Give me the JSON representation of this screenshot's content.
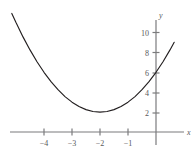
{
  "chart_data": {
    "type": "line",
    "title": "",
    "xlabel": "x",
    "ylabel": "y",
    "equation": "y = (x + 2)^2 + 2",
    "vertex": [
      -2,
      2
    ],
    "y_intercept": 6,
    "xlim": [
      -5.2,
      0.7
    ],
    "ylim": [
      -0.6,
      11.6
    ],
    "grid": false,
    "legend": null,
    "x_ticks": [
      -4,
      -3,
      -2,
      -1
    ],
    "x_tick_labels": [
      "−4",
      "−3",
      "−2",
      "−1"
    ],
    "y_ticks": [
      2,
      4,
      6,
      8,
      10
    ],
    "y_tick_labels": [
      "2",
      "4",
      "6",
      "8",
      "10"
    ],
    "series": [
      {
        "name": "parabola",
        "color": "#231f20",
        "x": [
          -5.15,
          -5.0,
          -4.75,
          -4.5,
          -4.25,
          -4.0,
          -3.75,
          -3.5,
          -3.25,
          -3.0,
          -2.75,
          -2.5,
          -2.25,
          -2.0,
          -1.75,
          -1.5,
          -1.25,
          -1.0,
          -0.75,
          -0.5,
          -0.25,
          0.0,
          0.25,
          0.5,
          0.65
        ],
        "y": [
          11.92,
          11.0,
          9.56,
          8.25,
          7.06,
          6.0,
          5.06,
          4.25,
          3.56,
          3.0,
          2.56,
          2.25,
          2.06,
          2.0,
          2.06,
          2.25,
          2.56,
          3.0,
          3.56,
          4.25,
          5.06,
          6.0,
          7.06,
          8.25,
          9.02
        ]
      }
    ],
    "axis_color": "#7b7b7d",
    "curve_color": "#231f20"
  }
}
